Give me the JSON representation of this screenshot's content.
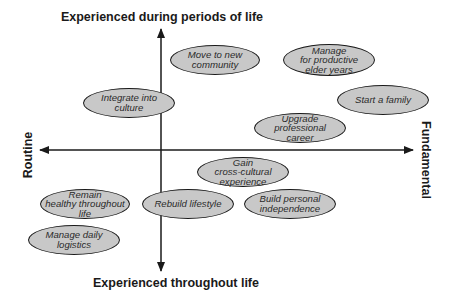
{
  "diagram": {
    "type": "quadrant",
    "axes": {
      "top": "Experienced during periods of life",
      "bottom": "Experienced throughout life",
      "left": "Routine",
      "right": "Fundamental"
    },
    "colors": {
      "ellipse_fill": "#c8c8c8",
      "ellipse_stroke": "#1a1a1a",
      "axis": "#1a1a1a",
      "background": "#ffffff"
    },
    "nodes": [
      {
        "id": "move",
        "label": "Move to new\ncommunity",
        "cx": 215,
        "cy": 60,
        "rx": 45,
        "ry": 15
      },
      {
        "id": "elder",
        "label": "Manage\nfor productive\nelder years",
        "cx": 329,
        "cy": 60,
        "rx": 46,
        "ry": 16
      },
      {
        "id": "integrate",
        "label": "Integrate into\nculture",
        "cx": 129,
        "cy": 103,
        "rx": 46,
        "ry": 15
      },
      {
        "id": "family",
        "label": "Start a family",
        "cx": 383,
        "cy": 100,
        "rx": 46,
        "ry": 15
      },
      {
        "id": "career",
        "label": "Upgrade\nprofessional\ncareer",
        "cx": 300,
        "cy": 128,
        "rx": 46,
        "ry": 15
      },
      {
        "id": "crosscultural",
        "label": "Gain\ncross-cultural\nexperience",
        "cx": 243,
        "cy": 172,
        "rx": 46,
        "ry": 15
      },
      {
        "id": "healthy",
        "label": "Remain\nhealthy throughout\nlife",
        "cx": 85,
        "cy": 204,
        "rx": 45,
        "ry": 15
      },
      {
        "id": "rebuild",
        "label": "Rebuild lifestyle",
        "cx": 188,
        "cy": 204,
        "rx": 46,
        "ry": 15
      },
      {
        "id": "independence",
        "label": "Build personal\nindependence",
        "cx": 290,
        "cy": 204,
        "rx": 46,
        "ry": 15
      },
      {
        "id": "logistics",
        "label": "Manage daily\nlogistics",
        "cx": 74,
        "cy": 240,
        "rx": 46,
        "ry": 15
      }
    ]
  }
}
